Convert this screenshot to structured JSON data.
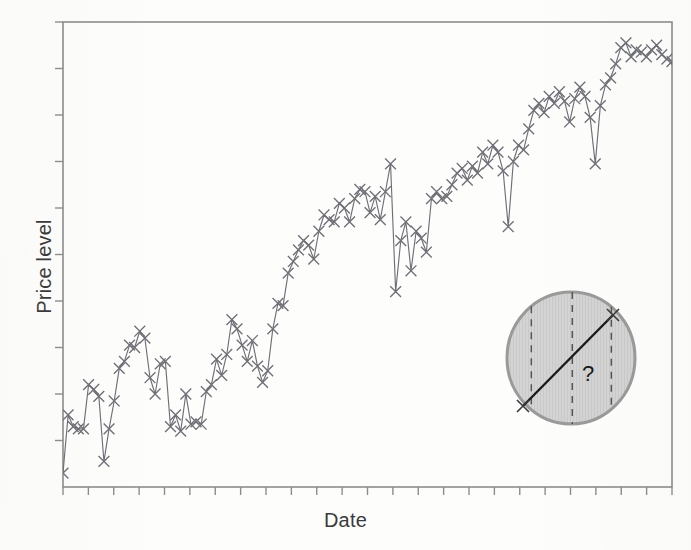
{
  "figure": {
    "background_color": "#fdfdfc",
    "frame_color": "#8d8d8d",
    "series_color": "#6f6f76",
    "annotation_fill": "#d2d2d2",
    "annotation_stroke": "#9a9a9a",
    "annotation_line_color": "#1a1a1a"
  },
  "labels": {
    "ylabel": "Price level",
    "xlabel": "Date",
    "question_mark": "?"
  },
  "chart_data": {
    "type": "line",
    "title": "",
    "subtitle": "",
    "xlabel": "Date",
    "ylabel": "Price level",
    "marker": "x",
    "grid": false,
    "legend": null,
    "xlim": [
      0,
      119
    ],
    "ylim": [
      0,
      100
    ],
    "x_tick_labels": [],
    "y_tick_labels": [],
    "x_major_ticks": 24,
    "y_major_ticks": 10,
    "annotations": [
      {
        "type": "circle-highlight",
        "label": "?",
        "note": "shaded circle highlighting the last visible segment and extrapolated trend",
        "center_x": 102,
        "center_y": 24,
        "radius_px": 64,
        "dashed_verticals": 3,
        "trend_line_from": [
          96.5,
          12.0
        ],
        "trend_line_to": [
          108.5,
          36.0
        ]
      }
    ],
    "x": [
      0,
      1,
      2,
      3,
      4,
      5,
      6,
      7,
      8,
      9,
      10,
      11,
      12,
      13,
      14,
      15,
      16,
      17,
      18,
      19,
      20,
      21,
      22,
      23,
      24,
      25,
      26,
      27,
      28,
      29,
      30,
      31,
      32,
      33,
      34,
      35,
      36,
      37,
      38,
      39,
      40,
      41,
      42,
      43,
      44,
      45,
      46,
      47,
      48,
      49,
      50,
      51,
      52,
      53,
      54,
      55,
      56,
      57,
      58,
      59,
      60,
      61,
      62,
      63,
      64,
      65,
      66,
      67,
      68,
      69,
      70,
      71,
      72,
      73,
      74,
      75,
      76,
      77,
      78,
      79,
      80,
      81,
      82,
      83,
      84,
      85,
      86,
      87,
      88,
      89,
      90,
      91,
      92,
      93,
      94,
      95,
      96,
      97,
      98,
      99,
      100,
      101,
      102,
      103,
      104,
      105,
      106,
      107,
      108,
      109,
      110,
      111,
      112,
      113,
      114,
      115,
      116,
      117,
      118,
      119
    ],
    "values": [
      3.0,
      15.5,
      13.0,
      12.5,
      12.5,
      22.0,
      21.0,
      19.5,
      5.5,
      12.5,
      18.5,
      25.5,
      27.0,
      30.5,
      30.0,
      33.5,
      32.0,
      23.5,
      20.0,
      26.5,
      27.0,
      13.0,
      15.5,
      12.0,
      20.0,
      13.5,
      14.0,
      13.5,
      20.5,
      22.0,
      27.5,
      24.0,
      28.5,
      36.0,
      34.0,
      30.5,
      27.0,
      31.5,
      26.0,
      22.5,
      25.0,
      34.0,
      39.5,
      39.0,
      46.0,
      48.5,
      51.0,
      53.0,
      52.0,
      49.0,
      55.0,
      58.5,
      57.5,
      57.0,
      61.0,
      60.0,
      57.0,
      62.0,
      64.0,
      63.5,
      59.0,
      62.5,
      57.5,
      63.5,
      69.5,
      42.0,
      53.0,
      57.0,
      46.5,
      55.0,
      53.5,
      50.5,
      62.0,
      63.5,
      62.0,
      62.5,
      65.0,
      67.5,
      68.5,
      66.0,
      69.0,
      67.5,
      72.0,
      69.5,
      73.5,
      72.0,
      68.0,
      56.0,
      70.0,
      73.5,
      72.5,
      77.0,
      81.0,
      82.5,
      80.5,
      84.0,
      82.5,
      85.0,
      83.0,
      78.5,
      83.5,
      86.0,
      84.0,
      79.5,
      69.5,
      82.0,
      86.5,
      88.0,
      91.0,
      94.5,
      95.5,
      92.5,
      94.0,
      93.5,
      92.5,
      94.0,
      95.0,
      93.0,
      92.0,
      91.5
    ]
  }
}
